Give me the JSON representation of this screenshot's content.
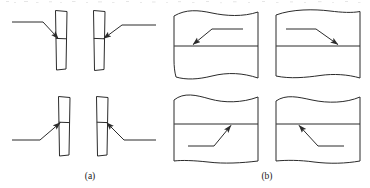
{
  "figure": {
    "kind": "engineering-line-drawing",
    "background_color": "#ffffff",
    "line_color": "#2b2b2b",
    "groups": [
      {
        "id": "a",
        "caption": "(a)",
        "caption_x": 90,
        "caption_y": 176,
        "style": "narrow-vertical-bar",
        "note": "Plate seen edge-on: tall narrow rectangle with a horizontal interface line",
        "panels": [
          {
            "name": "panel-a1",
            "bar_x": 55,
            "bar_y": 10,
            "bar_w": 12,
            "bar_h": 60,
            "interface_y": 38,
            "leader_from_x": 12,
            "leader_from_y": 22,
            "leader_elbow_x": 43,
            "leader_elbow_y": 22,
            "arrow_tip_x": 58,
            "arrow_tip_y": 39,
            "arrow_direction": "down-right",
            "arrow_side": "left"
          },
          {
            "name": "panel-a2",
            "bar_x": 93,
            "bar_y": 10,
            "bar_w": 12,
            "bar_h": 60,
            "interface_y": 38,
            "leader_from_x": 155,
            "leader_from_y": 25,
            "leader_elbow_x": 122,
            "leader_elbow_y": 25,
            "arrow_tip_x": 104,
            "arrow_tip_y": 39,
            "arrow_direction": "down-left",
            "arrow_side": "right"
          },
          {
            "name": "panel-a3",
            "bar_x": 58,
            "bar_y": 96,
            "bar_w": 12,
            "bar_h": 60,
            "interface_y": 122,
            "leader_from_x": 12,
            "leader_from_y": 140,
            "leader_elbow_x": 40,
            "leader_elbow_y": 140,
            "arrow_tip_x": 60,
            "arrow_tip_y": 122,
            "arrow_direction": "up-right",
            "arrow_side": "left"
          },
          {
            "name": "panel-a4",
            "bar_x": 96,
            "bar_y": 96,
            "bar_w": 12,
            "bar_h": 60,
            "interface_y": 122,
            "leader_from_x": 155,
            "leader_from_y": 140,
            "leader_elbow_x": 124,
            "leader_elbow_y": 140,
            "arrow_tip_x": 107,
            "arrow_tip_y": 122,
            "arrow_direction": "up-left",
            "arrow_side": "right"
          }
        ]
      },
      {
        "id": "b",
        "caption": "(b)",
        "caption_x": 267,
        "caption_y": 176,
        "style": "broken-section-panel",
        "note": "Section view: wide panel with freehand break lines and a straight horizontal interface line",
        "panels": [
          {
            "name": "panel-b1",
            "x": 174,
            "y": 11,
            "w": 84,
            "h": 67,
            "interface_y": 46,
            "break_edges": [
              "top",
              "bottom"
            ],
            "leader_from_x": 242,
            "leader_from_y": 29,
            "leader_elbow_x": 212,
            "leader_elbow_y": 29,
            "arrow_tip_x": 194,
            "arrow_tip_y": 45,
            "arrow_direction": "down-left"
          },
          {
            "name": "panel-b2",
            "x": 276,
            "y": 11,
            "w": 84,
            "h": 67,
            "interface_y": 46,
            "break_edges": [
              "top",
              "bottom"
            ],
            "leader_from_x": 286,
            "leader_from_y": 29,
            "leader_elbow_x": 316,
            "leader_elbow_y": 29,
            "arrow_tip_x": 339,
            "arrow_tip_y": 45,
            "arrow_direction": "down-right"
          },
          {
            "name": "panel-b3",
            "x": 174,
            "y": 97,
            "w": 84,
            "h": 64,
            "interface_y": 124,
            "break_edges": [
              "top",
              "bottom"
            ],
            "leader_from_x": 188,
            "leader_from_y": 146,
            "leader_elbow_x": 214,
            "leader_elbow_y": 146,
            "arrow_tip_x": 232,
            "arrow_tip_y": 125,
            "arrow_direction": "up-right"
          },
          {
            "name": "panel-b4",
            "x": 276,
            "y": 97,
            "w": 84,
            "h": 64,
            "interface_y": 124,
            "break_edges": [
              "top",
              "bottom"
            ],
            "leader_from_x": 344,
            "leader_from_y": 146,
            "leader_elbow_x": 318,
            "leader_elbow_y": 146,
            "arrow_tip_x": 298,
            "arrow_tip_y": 125,
            "arrow_direction": "up-left"
          }
        ]
      }
    ]
  }
}
